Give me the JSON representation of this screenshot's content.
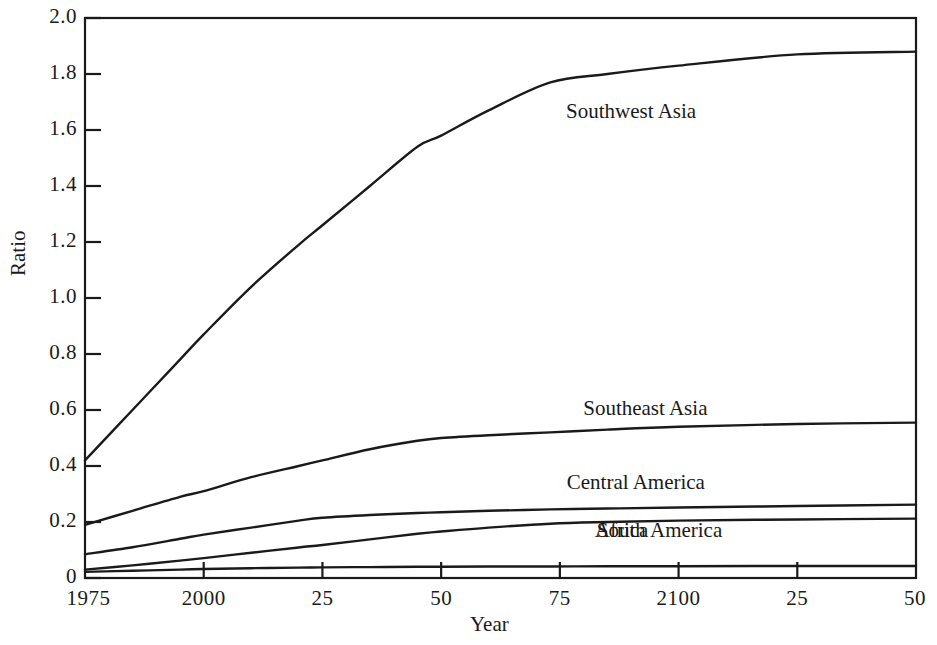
{
  "chart_data": {
    "type": "line",
    "title": "",
    "xlabel": "Year",
    "ylabel": "Ratio",
    "xlim": [
      1975,
      2150
    ],
    "ylim": [
      0,
      2.0
    ],
    "grid": false,
    "legend_position": "inline-labels",
    "x_tick_values": [
      1975,
      2000,
      2025,
      2050,
      2075,
      2100,
      2125,
      2150
    ],
    "x_tick_labels": [
      "1975",
      "2000",
      "25",
      "50",
      "75",
      "2100",
      "25",
      "50"
    ],
    "y_tick_values": [
      0,
      0.2,
      0.4,
      0.6,
      0.8,
      1.0,
      1.2,
      1.4,
      1.6,
      1.8,
      2.0
    ],
    "y_tick_labels": [
      "0",
      "0.2",
      "0.4",
      "0.6",
      "0.8",
      "1.0",
      "1.2",
      "1.4",
      "1.6",
      "1.8",
      "2.0"
    ],
    "x": [
      1975,
      1985,
      1995,
      2000,
      2010,
      2020,
      2025,
      2035,
      2045,
      2050,
      2060,
      2073,
      2085,
      2100,
      2125,
      2150
    ],
    "series": [
      {
        "name": "Southwest Asia",
        "values": [
          0.42,
          0.6,
          0.78,
          0.87,
          1.04,
          1.19,
          1.26,
          1.4,
          1.54,
          1.58,
          1.67,
          1.77,
          1.8,
          1.83,
          1.87,
          1.88
        ],
        "label_x": 2090,
        "label_y": 1.66
      },
      {
        "name": "Southeast Asia",
        "values": [
          0.19,
          0.24,
          0.29,
          0.31,
          0.36,
          0.4,
          0.42,
          0.46,
          0.49,
          0.5,
          0.51,
          0.52,
          0.53,
          0.54,
          0.55,
          0.555
        ],
        "label_x": 2093,
        "label_y": 0.6
      },
      {
        "name": "Central America",
        "values": [
          0.085,
          0.11,
          0.14,
          0.155,
          0.18,
          0.205,
          0.215,
          0.225,
          0.232,
          0.235,
          0.24,
          0.245,
          0.248,
          0.252,
          0.257,
          0.262
        ],
        "label_x": 2091,
        "label_y": 0.335
      },
      {
        "name": "Africa",
        "values": [
          0.03,
          0.045,
          0.062,
          0.071,
          0.09,
          0.109,
          0.118,
          0.138,
          0.158,
          0.166,
          0.18,
          0.194,
          0.2,
          0.205,
          0.209,
          0.212
        ],
        "label_x": 2088,
        "label_y": 0.165
      },
      {
        "name": "South America",
        "values": [
          0.022,
          0.026,
          0.03,
          0.032,
          0.035,
          0.037,
          0.038,
          0.039,
          0.04,
          0.04,
          0.041,
          0.041,
          0.042,
          0.042,
          0.043,
          0.043
        ],
        "label_x": 2096,
        "label_y": 0.165
      }
    ]
  },
  "labels": {
    "x_axis_title": "Year",
    "y_axis_title": "Ratio"
  }
}
